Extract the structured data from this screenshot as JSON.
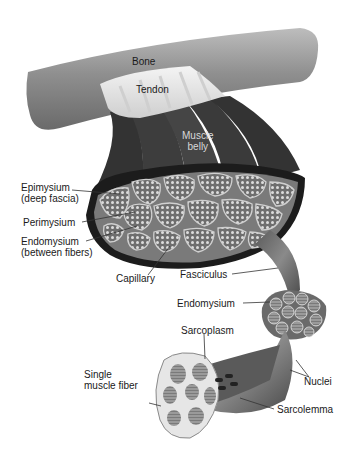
{
  "diagram": {
    "labels": {
      "bone": "Bone",
      "tendon": "Tendon",
      "muscle_belly_1": "Muscle",
      "muscle_belly_2": "belly",
      "epimysium_1": "Epimysium",
      "epimysium_2": "(deep fascia)",
      "perimysium": "Perimysium",
      "endomysium_main_1": "Endomysium",
      "endomysium_main_2": "(between fibers)",
      "capillary": "Capillary",
      "fasciculus": "Fasciculus",
      "endomysium_fascicle": "Endomysium",
      "sarcoplasm": "Sarcoplasm",
      "single_fiber_1": "Single",
      "single_fiber_2": "muscle fiber",
      "nuclei": "Nuclei",
      "sarcolemma": "Sarcolemma"
    },
    "colors": {
      "background": "#ffffff",
      "bone": "#9a9a9a",
      "tendon": "#e6e6e6",
      "muscle": "#3a3a3a",
      "fascicle_fill": "#8a8a8a",
      "fiber_dot": "#d9d9d9",
      "label_text": "#1a1a1a",
      "leader_line": "#333333"
    }
  }
}
